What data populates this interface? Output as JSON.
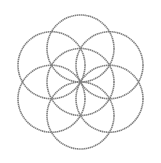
{
  "figure": {
    "width": 161,
    "height": 163,
    "background": "#ffffff",
    "stroke_color": "#7f7f7f",
    "stroke_width": 1.6,
    "radius": 33.5,
    "center": {
      "x": 80.5,
      "y": 82
    },
    "circles": [
      {
        "name": "center-circle",
        "cx": 80.5,
        "cy": 82
      },
      {
        "name": "top-circle",
        "cx": 80.5,
        "cy": 48.5
      },
      {
        "name": "top-right-circle",
        "cx": 109.5,
        "cy": 65.25
      },
      {
        "name": "bottom-right-circle",
        "cx": 109.5,
        "cy": 98.75
      },
      {
        "name": "bottom-circle",
        "cx": 80.5,
        "cy": 115.5
      },
      {
        "name": "bottom-left-circle",
        "cx": 51.5,
        "cy": 98.75
      },
      {
        "name": "top-left-circle",
        "cx": 51.5,
        "cy": 65.25
      }
    ]
  }
}
